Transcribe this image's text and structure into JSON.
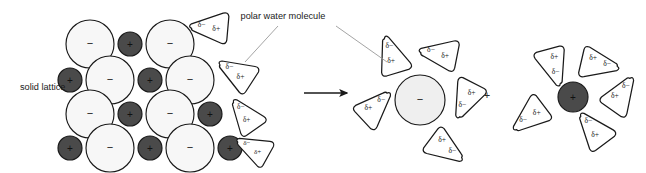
{
  "figure": {
    "background": "#ffffff",
    "width": 646,
    "height": 173
  },
  "labels": {
    "solid_lattice": "solid lattice",
    "polar_water_molecule": "polar water molecule"
  },
  "symbols": {
    "anion": "−",
    "cation": "+",
    "delta_minus": "δ−",
    "delta_plus": "δ+",
    "plus_separator": "+",
    "arrow": "→"
  },
  "colors": {
    "anion_fill": "#f7f7f7",
    "anion_fill_solvated": "#efefef",
    "cation_fill": "#4a4a4a",
    "outline": "#1a1a1a",
    "water_fill": "#ffffff",
    "text": "#1a1a1a",
    "leader_line": "#9a9a9a",
    "arrow": "#1a1a1a"
  },
  "lattice": {
    "name": "solid lattice",
    "rows": [
      {
        "index": 0,
        "cy": 44,
        "particles": [
          {
            "type": "anion",
            "sign": "−",
            "cx": 90,
            "r": 24
          },
          {
            "type": "cation",
            "sign": "+",
            "cx": 130,
            "r": 12
          },
          {
            "type": "anion",
            "sign": "−",
            "cx": 170,
            "r": 24
          }
        ]
      },
      {
        "index": 1,
        "cy": 80,
        "particles": [
          {
            "type": "cation",
            "sign": "+",
            "cx": 70,
            "r": 12
          },
          {
            "type": "anion",
            "sign": "−",
            "cx": 110,
            "r": 24
          },
          {
            "type": "cation",
            "sign": "+",
            "cx": 150,
            "r": 12
          },
          {
            "type": "anion",
            "sign": "−",
            "cx": 190,
            "r": 24
          }
        ]
      },
      {
        "index": 2,
        "cy": 114,
        "particles": [
          {
            "type": "anion",
            "sign": "−",
            "cx": 90,
            "r": 24
          },
          {
            "type": "cation",
            "sign": "+",
            "cx": 130,
            "r": 12
          },
          {
            "type": "anion",
            "sign": "−",
            "cx": 170,
            "r": 24
          },
          {
            "type": "cation",
            "sign": "+",
            "cx": 210,
            "r": 12
          }
        ]
      },
      {
        "index": 3,
        "cy": 148,
        "particles": [
          {
            "type": "cation",
            "sign": "+",
            "cx": 70,
            "r": 12
          },
          {
            "type": "anion",
            "sign": "−",
            "cx": 110,
            "r": 24
          },
          {
            "type": "cation",
            "sign": "+",
            "cx": 150,
            "r": 12
          },
          {
            "type": "anion",
            "sign": "−",
            "cx": 190,
            "r": 24
          },
          {
            "type": "cation",
            "sign": "+",
            "cx": 230,
            "r": 12
          }
        ]
      }
    ]
  },
  "free_water_molecules": [
    {
      "id": "water-free-1",
      "cx": 214,
      "cy": 30,
      "rot": -28,
      "scale": 1.0,
      "d_minus": "δ−",
      "d_plus": "δ+"
    },
    {
      "id": "water-free-2",
      "cx": 239,
      "cy": 77,
      "rot": 0,
      "scale": 1.0,
      "d_minus": "δ−",
      "d_plus": "δ+"
    },
    {
      "id": "water-free-3",
      "cx": 246,
      "cy": 120,
      "rot": 22,
      "scale": 0.95,
      "d_minus": "δ−",
      "d_plus": "δ+"
    },
    {
      "id": "water-free-4",
      "cx": 256,
      "cy": 152,
      "rot": -4,
      "scale": 0.92,
      "d_minus": "δ−",
      "d_plus": "δ+"
    }
  ],
  "reaction_arrow": {
    "x1": 304,
    "y1": 93,
    "x2": 347,
    "y2": 93
  },
  "plus_separator": {
    "x": 487,
    "y": 99,
    "text": "+"
  },
  "hydrated_anion": {
    "name": "hydrated anion",
    "center": {
      "cx": 420,
      "cy": 100,
      "r": 25,
      "sign": "−",
      "type": "anion"
    },
    "shell": [
      {
        "id": "wa-1",
        "angle": 126,
        "dist": 49,
        "rot": 40,
        "d_minus": "δ−",
        "d_plus": "δ+"
      },
      {
        "id": "wa-2",
        "angle": 62,
        "dist": 49,
        "rot": -22,
        "d_minus": "δ−",
        "d_plus": "δ+"
      },
      {
        "id": "wa-3",
        "angle": 4,
        "dist": 50,
        "rot": -96,
        "d_minus": "δ−",
        "d_plus": "δ+"
      },
      {
        "id": "wa-4",
        "angle": -62,
        "dist": 50,
        "rot": -176,
        "d_minus": "δ−",
        "d_plus": "δ+"
      },
      {
        "id": "wa-5",
        "angle": 190,
        "dist": 50,
        "rot": 104,
        "d_minus": "δ−",
        "d_plus": "δ+"
      }
    ]
  },
  "hydrated_cation": {
    "name": "hydrated cation",
    "center": {
      "cx": 573,
      "cy": 97,
      "r": 15,
      "sign": "+",
      "type": "cation"
    },
    "shell": [
      {
        "id": "wc-1",
        "angle": 118,
        "dist": 40,
        "rot": 222,
        "d_minus": "δ−",
        "d_plus": "δ+"
      },
      {
        "id": "wc-2",
        "angle": 58,
        "dist": 42,
        "rot": 160,
        "d_minus": "δ−",
        "d_plus": "δ+"
      },
      {
        "id": "wc-3",
        "angle": 0,
        "dist": 44,
        "rot": 92,
        "d_minus": "δ−",
        "d_plus": "δ+"
      },
      {
        "id": "wc-4",
        "angle": -60,
        "dist": 43,
        "rot": 20,
        "d_minus": "δ−",
        "d_plus": "δ+"
      },
      {
        "id": "wc-5",
        "angle": 206,
        "dist": 43,
        "rot": -70,
        "d_minus": "δ−",
        "d_plus": "δ+"
      }
    ]
  },
  "leader_lines": [
    {
      "id": "leader-to-free-water",
      "x1": 278,
      "y1": 26,
      "x2": 245,
      "y2": 62
    },
    {
      "id": "leader-to-shell-water",
      "x1": 336,
      "y1": 26,
      "x2": 387,
      "y2": 62
    }
  ],
  "label_positions": {
    "solid_lattice": {
      "x": 20,
      "y": 90
    },
    "polar_water_molecule": {
      "x": 283,
      "y": 19
    }
  }
}
